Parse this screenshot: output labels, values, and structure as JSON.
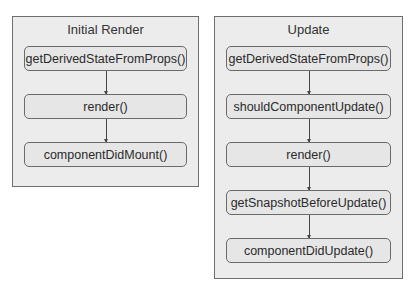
{
  "diagram": {
    "panels": [
      {
        "title": "Initial Render",
        "steps": [
          "getDerivedStateFromProps()",
          "render()",
          "componentDidMount()"
        ]
      },
      {
        "title": "Update",
        "steps": [
          "getDerivedStateFromProps()",
          "shouldComponentUpdate()",
          "render()",
          "getSnapshotBeforeUpdate()",
          "componentDidUpdate()"
        ]
      }
    ]
  },
  "colors": {
    "panel_bg": "#ececec",
    "panel_border": "#6e6e6e",
    "box_bg": "#e6e6e6",
    "box_border": "#6a6a6a",
    "arrow": "#444444"
  }
}
